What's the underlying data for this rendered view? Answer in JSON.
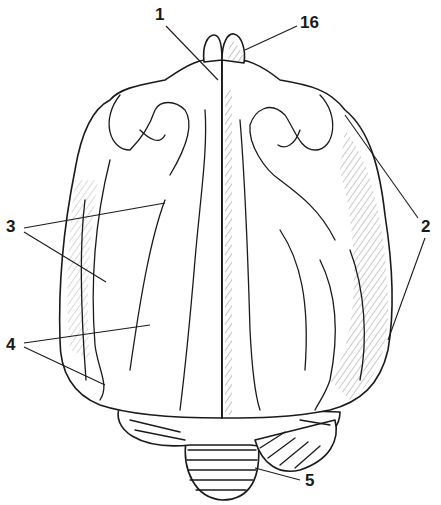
{
  "figure": {
    "colors": {
      "line": "#1a1a1a",
      "background": "#ffffff"
    }
  },
  "labels": [
    {
      "id": "1",
      "text": "1",
      "x": 155,
      "y": 6
    },
    {
      "id": "16",
      "text": "16",
      "x": 300,
      "y": 14
    },
    {
      "id": "2",
      "text": "2",
      "x": 421,
      "y": 218
    },
    {
      "id": "3",
      "text": "3",
      "x": 6,
      "y": 218
    },
    {
      "id": "4",
      "text": "4",
      "x": 6,
      "y": 336
    },
    {
      "id": "5",
      "text": "5",
      "x": 305,
      "y": 472
    }
  ]
}
